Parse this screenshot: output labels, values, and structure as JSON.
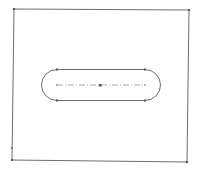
{
  "sketch": {
    "background": "#ffffff",
    "line_color": "#6e6e6e",
    "centerline_color": "#9a9a9a",
    "point_color": "#555555",
    "rectangle": {
      "corners": [
        [
          14,
          9
        ],
        [
          189,
          10
        ],
        [
          187,
          162
        ],
        [
          12,
          160
        ]
      ]
    },
    "slot": {
      "type": "straight-slot",
      "center": [
        100,
        85
      ],
      "arc_centers": [
        [
          57,
          85
        ],
        [
          145,
          85
        ]
      ],
      "radius": 15.5,
      "top_y": 69.5,
      "bottom_y": 100.5
    }
  }
}
